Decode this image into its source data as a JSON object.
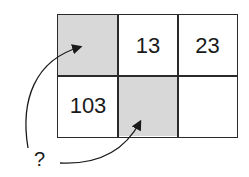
{
  "grid": {
    "rows": 2,
    "cols": 3,
    "cells": [
      {
        "row": 0,
        "col": 0,
        "value": "",
        "shaded": true
      },
      {
        "row": 0,
        "col": 1,
        "value": "13",
        "shaded": false
      },
      {
        "row": 0,
        "col": 2,
        "value": "23",
        "shaded": false
      },
      {
        "row": 1,
        "col": 0,
        "value": "103",
        "shaded": false
      },
      {
        "row": 1,
        "col": 1,
        "value": "",
        "shaded": true
      },
      {
        "row": 1,
        "col": 2,
        "value": "",
        "shaded": false
      }
    ]
  },
  "question_mark": "?",
  "colors": {
    "shade": "#d8d8d8",
    "line": "#2a2a2a"
  }
}
